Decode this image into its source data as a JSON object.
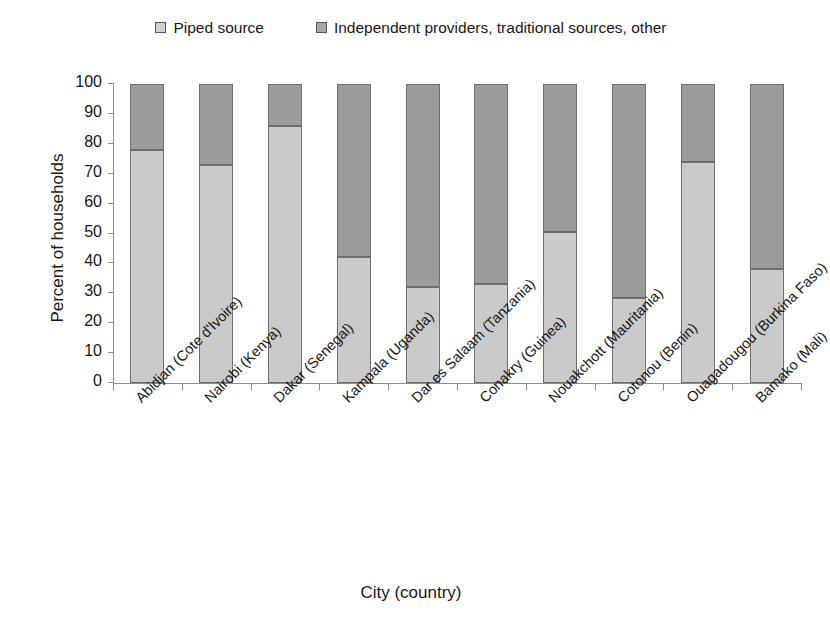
{
  "chart_data": {
    "type": "bar",
    "subtype": "stacked-column-100",
    "title": "",
    "xlabel": "City (country)",
    "ylabel": "Percent of households",
    "ylim": [
      0,
      100
    ],
    "ytick_step": 10,
    "ytick_labels": [
      "100",
      "90",
      "80",
      "70",
      "60",
      "50",
      "40",
      "30",
      "20",
      "10",
      "0"
    ],
    "grid": false,
    "legend_position": "top",
    "categories": [
      "Abidjan (Cote d'Ivoire)",
      "Nairobi (Kenya)",
      "Dakar (Senegal)",
      "Kampala (Uganda)",
      "Dar es Salaam (Tanzania)",
      "Conakry (Guinea)",
      "Nouakchott (Mauritania)",
      "Cotonou (Benin)",
      "Ouagadougou (Burkina Faso)",
      "Bamako (Mali)"
    ],
    "series": [
      {
        "name": "Piped source",
        "color": "#cacaca",
        "values": [
          78,
          73,
          86,
          42,
          32,
          33,
          50.5,
          28.5,
          74,
          38
        ]
      },
      {
        "name": "Independent providers, traditional sources, other",
        "color": "#9c9c9c",
        "values": [
          22,
          27,
          14,
          58,
          68,
          67,
          49.5,
          71.5,
          26,
          62
        ]
      }
    ]
  },
  "legend": {
    "items": [
      {
        "label": "Piped source",
        "swatch": "piped-source-swatch"
      },
      {
        "label": "Independent providers, traditional sources, other",
        "swatch": "independent-providers-swatch"
      }
    ]
  },
  "axes": {
    "y_title": "Percent of households",
    "x_title": "City (country)"
  }
}
